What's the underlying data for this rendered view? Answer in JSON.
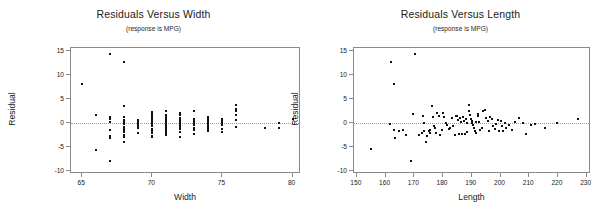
{
  "figure": {
    "width": 614,
    "height": 218,
    "background": "#ffffff",
    "point_color": "#111111",
    "axis_color": "#8a8a8a",
    "text_color": "#1a1a1a"
  },
  "chart_data": [
    {
      "type": "scatter",
      "id": "residuals-versus-width",
      "title": "Residuals Versus Width",
      "subtitle": "(response is MPG)",
      "xlabel": "Width",
      "ylabel": "Residual",
      "xlim": [
        64.2,
        80.6
      ],
      "ylim": [
        -10.6,
        15.6
      ],
      "xticks": [
        65,
        70,
        75,
        80
      ],
      "yticks": [
        -10,
        -5,
        0,
        5,
        10,
        15
      ],
      "xticklabels": [
        "65",
        "70",
        "75",
        "80"
      ],
      "yticklabels": [
        "-10",
        "-5",
        "0",
        "5",
        "10",
        "15"
      ],
      "grid": false,
      "legend": false,
      "reference_line": {
        "y": 0,
        "style": "dotted"
      },
      "x": [
        65.0,
        66.0,
        66.0,
        67.0,
        67.0,
        67.0,
        67.0,
        67.0,
        67.0,
        67.0,
        67.0,
        68.0,
        68.0,
        68.0,
        68.0,
        68.0,
        68.0,
        68.0,
        68.0,
        68.0,
        68.0,
        68.0,
        68.0,
        68.0,
        68.0,
        69.0,
        69.0,
        69.0,
        69.0,
        69.0,
        69.0,
        70.0,
        70.0,
        70.0,
        70.0,
        70.0,
        70.0,
        70.0,
        70.0,
        70.0,
        70.0,
        70.0,
        70.0,
        70.0,
        71.0,
        71.0,
        71.0,
        71.0,
        71.0,
        71.0,
        71.0,
        71.0,
        71.0,
        71.0,
        71.0,
        71.0,
        71.0,
        71.0,
        71.0,
        72.0,
        72.0,
        72.0,
        72.0,
        72.0,
        72.0,
        72.0,
        72.0,
        72.0,
        72.0,
        72.0,
        73.0,
        73.0,
        73.0,
        73.0,
        73.0,
        73.0,
        73.0,
        73.0,
        74.0,
        74.0,
        74.0,
        74.0,
        74.0,
        74.0,
        74.0,
        74.0,
        75.0,
        75.0,
        75.0,
        75.0,
        75.0,
        75.0,
        76.0,
        76.0,
        76.0,
        76.0,
        76.0,
        76.0,
        78.0,
        78.0,
        79.0,
        79.0,
        80.0
      ],
      "y": [
        8.1,
        1.7,
        -5.6,
        14.3,
        1.2,
        0.8,
        0.2,
        -1.4,
        -2.8,
        -3.1,
        -8.0,
        12.6,
        3.6,
        1.3,
        0.7,
        0.3,
        0.0,
        -0.3,
        -0.8,
        -1.1,
        -1.5,
        -1.9,
        -2.5,
        -3.0,
        -4.0,
        0.6,
        0.2,
        -0.2,
        -0.6,
        -1.1,
        -2.0,
        2.3,
        1.9,
        1.5,
        1.0,
        0.6,
        0.2,
        -0.2,
        -0.7,
        -1.2,
        -1.6,
        -2.1,
        -2.6,
        -3.0,
        2.5,
        1.6,
        1.2,
        0.9,
        0.6,
        0.3,
        0.0,
        -0.3,
        -0.6,
        -0.9,
        -1.2,
        -1.5,
        -1.8,
        -2.1,
        -2.4,
        2.0,
        1.6,
        1.1,
        0.7,
        0.3,
        -0.1,
        -0.5,
        -0.9,
        -1.3,
        -1.8,
        -2.9,
        2.5,
        0.9,
        0.4,
        0.0,
        -0.5,
        -1.0,
        -1.5,
        -2.3,
        1.2,
        0.8,
        0.4,
        0.0,
        -0.4,
        -0.8,
        -1.2,
        -1.6,
        0.9,
        0.4,
        0.0,
        -0.5,
        -1.2,
        -1.8,
        3.7,
        3.0,
        2.4,
        1.6,
        0.6,
        -0.8,
        -1.0,
        -1.1,
        0.1,
        -1.1,
        0.8
      ]
    },
    {
      "type": "scatter",
      "id": "residuals-versus-length",
      "title": "Residuals Versus Length",
      "subtitle": "(response is MPG)",
      "xlabel": "Length",
      "ylabel": "Residual",
      "xlim": [
        149.0,
        231.5
      ],
      "ylim": [
        -10.6,
        15.6
      ],
      "xticks": [
        150,
        160,
        170,
        180,
        190,
        200,
        210,
        220,
        230
      ],
      "yticks": [
        -10,
        -5,
        0,
        5,
        10,
        15
      ],
      "xticklabels": [
        "150",
        "160",
        "170",
        "180",
        "190",
        "200",
        "210",
        "220",
        "230"
      ],
      "yticklabels": [
        "-10",
        "-5",
        "0",
        "5",
        "10",
        "15"
      ],
      "grid": false,
      "legend": false,
      "reference_line": {
        "y": 0,
        "style": "dotted"
      },
      "x": [
        155.0,
        161.5,
        162.0,
        163.0,
        163.3,
        163.0,
        164.5,
        166.0,
        167.0,
        169.0,
        169.5,
        170.3,
        171.5,
        172.5,
        173.0,
        173.2,
        173.5,
        174.0,
        174.5,
        175.0,
        175.3,
        175.5,
        176.0,
        176.5,
        177.0,
        177.2,
        177.5,
        178.0,
        178.5,
        179.0,
        179.5,
        180.0,
        180.5,
        181.0,
        181.5,
        182.0,
        182.5,
        183.0,
        183.5,
        184.0,
        184.5,
        185.0,
        185.3,
        185.5,
        186.0,
        186.2,
        186.5,
        187.0,
        187.3,
        187.5,
        188.0,
        188.2,
        188.5,
        189.0,
        189.2,
        189.5,
        189.8,
        190.0,
        190.2,
        190.5,
        190.8,
        191.0,
        191.3,
        191.5,
        192.0,
        192.3,
        192.5,
        193.0,
        193.5,
        194.0,
        194.5,
        195.0,
        195.5,
        196.0,
        196.5,
        197.0,
        197.5,
        198.0,
        198.5,
        199.0,
        199.5,
        200.0,
        200.5,
        201.0,
        201.5,
        202.0,
        203.0,
        204.0,
        205.0,
        206.5,
        208.0,
        209.0,
        210.5,
        212.0,
        215.5,
        219.5,
        227.0
      ],
      "y": [
        -5.5,
        -0.2,
        12.6,
        8.1,
        -3.2,
        -1.5,
        -1.7,
        -1.5,
        -2.5,
        -8.0,
        1.8,
        14.3,
        -2.4,
        -2.1,
        1.5,
        0.1,
        -1.6,
        -4.0,
        -2.6,
        -1.6,
        -2.0,
        -1.4,
        3.6,
        1.3,
        -0.7,
        -1.0,
        -2.0,
        2.0,
        1.4,
        -2.5,
        -1.5,
        2.1,
        1.2,
        0.0,
        -0.5,
        -1.2,
        -1.0,
        1.0,
        -0.6,
        -2.5,
        1.5,
        1.4,
        0.6,
        -2.3,
        1.1,
        0.2,
        -2.2,
        1.2,
        0.5,
        -2.2,
        0.8,
        0.0,
        -1.8,
        3.8,
        2.4,
        1.6,
        0.9,
        0.4,
        0.0,
        -0.5,
        -1.0,
        -1.6,
        -2.0,
        0.3,
        1.9,
        1.4,
        0.2,
        -1.4,
        -1.1,
        2.6,
        2.7,
        1.0,
        0.4,
        -1.6,
        1.2,
        0.8,
        -0.6,
        -1.3,
        -0.2,
        0.6,
        -1.6,
        0.4,
        -0.7,
        -1.7,
        0.1,
        -1.0,
        -0.5,
        -1.5,
        0.3,
        1.1,
        0.0,
        -2.3,
        -0.4,
        -0.1,
        -1.1,
        0.1,
        0.8
      ]
    }
  ]
}
